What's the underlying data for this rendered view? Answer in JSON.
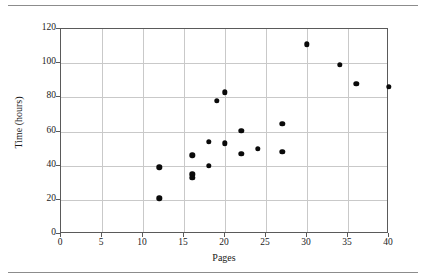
{
  "chart_data": {
    "type": "scatter",
    "title": "",
    "xlabel": "Pages",
    "ylabel": "Time (hours)",
    "xlim": [
      0,
      40
    ],
    "ylim": [
      0,
      120
    ],
    "xticks": [
      0,
      5,
      10,
      15,
      20,
      25,
      30,
      35,
      40
    ],
    "yticks": [
      0,
      20,
      40,
      60,
      80,
      100,
      120
    ],
    "xtick_labels": [
      "0",
      "5",
      "10",
      "15",
      "20",
      "25",
      "30",
      "35",
      "40"
    ],
    "ytick_labels": [
      "0",
      "20",
      "40",
      "60",
      "80",
      "100",
      "120"
    ],
    "grid": true,
    "legend": null,
    "marker": "filled-circle",
    "marker_color": "#0a0a0a",
    "points": [
      {
        "x": 12,
        "y": 39
      },
      {
        "x": 12,
        "y": 21
      },
      {
        "x": 16,
        "y": 46
      },
      {
        "x": 16,
        "y": 35
      },
      {
        "x": 16,
        "y": 33
      },
      {
        "x": 18,
        "y": 54
      },
      {
        "x": 18,
        "y": 40
      },
      {
        "x": 19,
        "y": 78
      },
      {
        "x": 20,
        "y": 83
      },
      {
        "x": 20,
        "y": 53
      },
      {
        "x": 22,
        "y": 60.5
      },
      {
        "x": 22,
        "y": 47
      },
      {
        "x": 24,
        "y": 50
      },
      {
        "x": 27,
        "y": 64.5
      },
      {
        "x": 27,
        "y": 48
      },
      {
        "x": 30,
        "y": 111
      },
      {
        "x": 34,
        "y": 99
      },
      {
        "x": 36,
        "y": 88
      },
      {
        "x": 40,
        "y": 86
      }
    ]
  },
  "figure": {
    "axis_color": "#5a5a5a",
    "grid_color": "#c9c9c9",
    "rule_color": "#8c8c8c"
  }
}
